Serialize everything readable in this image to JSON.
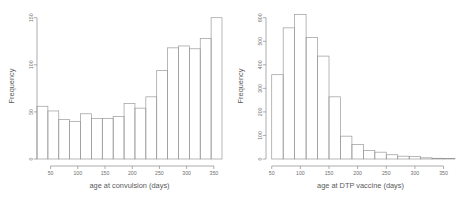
{
  "chart_data": [
    {
      "type": "bar",
      "subtype": "histogram",
      "title": "",
      "xlabel": "age at convulsion (days)",
      "ylabel": "Frequency",
      "xlim": [
        25,
        365
      ],
      "ylim": [
        0,
        155
      ],
      "xticks": [
        50,
        100,
        150,
        200,
        250,
        300,
        350
      ],
      "yticks": [
        0,
        50,
        100,
        150
      ],
      "grid": false,
      "legend": null,
      "bin_width": 20,
      "bin_edges": [
        25,
        45,
        65,
        85,
        105,
        125,
        145,
        165,
        185,
        205,
        225,
        245,
        265,
        285,
        305,
        325,
        345,
        365
      ],
      "categories": [
        "25-45",
        "45-65",
        "65-85",
        "85-105",
        "105-125",
        "125-145",
        "145-165",
        "165-185",
        "185-205",
        "205-225",
        "225-245",
        "245-265",
        "265-285",
        "285-305",
        "305-325",
        "325-345",
        "345-365"
      ],
      "values": [
        56,
        51,
        42,
        40,
        48,
        43,
        43,
        45,
        59,
        54,
        66,
        94,
        118,
        120,
        117,
        128,
        150,
        117
      ]
    },
    {
      "type": "bar",
      "subtype": "histogram",
      "title": "",
      "xlabel": "age at DTP vaccine (days)",
      "ylabel": "Frequency",
      "xlim": [
        40,
        370
      ],
      "ylim": [
        0,
        620
      ],
      "xticks": [
        50,
        100,
        150,
        200,
        250,
        300,
        350
      ],
      "yticks": [
        0,
        100,
        200,
        300,
        400,
        500,
        600
      ],
      "grid": false,
      "legend": null,
      "bin_width": 20,
      "bin_edges": [
        50,
        70,
        90,
        110,
        130,
        150,
        170,
        190,
        210,
        230,
        250,
        270,
        290,
        310,
        330,
        350,
        370
      ],
      "categories": [
        "50-70",
        "70-90",
        "90-110",
        "110-130",
        "130-150",
        "150-170",
        "170-190",
        "190-210",
        "210-230",
        "230-250",
        "250-270",
        "270-290",
        "290-310",
        "310-330",
        "330-350",
        "350-370"
      ],
      "values": [
        358,
        557,
        613,
        516,
        437,
        264,
        97,
        62,
        36,
        29,
        18,
        12,
        10,
        5,
        3,
        2
      ]
    }
  ],
  "panels": {
    "left": {
      "xlabel": "age at convulsion (days)",
      "ylabel": "Frequency",
      "xtick_labels": [
        "50",
        "100",
        "150",
        "200",
        "250",
        "300",
        "350"
      ],
      "ytick_labels": [
        "0",
        "50",
        "100",
        "150"
      ]
    },
    "right": {
      "xlabel": "age at DTP vaccine (days)",
      "ylabel": "Frequency",
      "xtick_labels": [
        "50",
        "100",
        "150",
        "200",
        "250",
        "300",
        "350"
      ],
      "ytick_labels": [
        "0",
        "100",
        "200",
        "300",
        "400",
        "500",
        "600"
      ]
    }
  },
  "colors": {
    "background": "#ffffff",
    "axis": "#8a8a8a",
    "bar_stroke": "#9a9a9a",
    "text": "#5a5a5a"
  }
}
